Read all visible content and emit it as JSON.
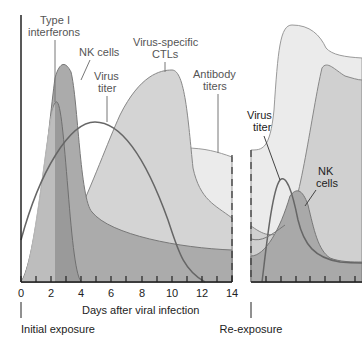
{
  "figure": {
    "type": "immune-response-timeline",
    "x_axis": {
      "label": "Days after viral infection",
      "ticks": [
        "0",
        "2",
        "4",
        "6",
        "8",
        "10",
        "12",
        "14"
      ]
    },
    "annotations": {
      "initial_exposure": "Initial exposure",
      "re_exposure": "Re-exposure"
    },
    "left_panel_labels": {
      "interferons_line1": "Type I",
      "interferons_line2": "interferons",
      "nk_cells": "NK cells",
      "virus_line1": "Virus",
      "virus_line2": "titer",
      "ctl_line1": "Virus-specific",
      "ctl_line2": "CTLs",
      "antibody_line1": "Antibody",
      "antibody_line2": "titers"
    },
    "right_panel_labels": {
      "virus_line1": "Virus",
      "virus_line2": "titer",
      "nk_line1": "NK",
      "nk_line2": "cells"
    },
    "colors": {
      "interferons": "#c8c8c8",
      "nk_cells": "#a9a9a9",
      "virus_line": "#6b6b6b",
      "ctls": "#d6d6d6",
      "antibody": "#e8e8e8",
      "outline": "#7a7a7a",
      "axis": "#222222"
    }
  }
}
